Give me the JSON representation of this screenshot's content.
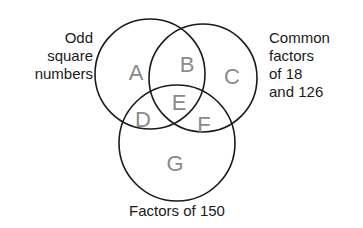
{
  "diagram": {
    "type": "venn",
    "sets": [
      {
        "id": "odd-square-numbers",
        "label_lines": [
          "Odd",
          "square",
          "numbers"
        ]
      },
      {
        "id": "common-factors",
        "label_lines": [
          "Common",
          "factors",
          "of 18",
          "and 126"
        ]
      },
      {
        "id": "factors-of-150",
        "label_lines": [
          "Factors of 150"
        ]
      }
    ],
    "regions": [
      {
        "letter": "A",
        "membership": [
          "odd-square-numbers"
        ]
      },
      {
        "letter": "B",
        "membership": [
          "odd-square-numbers",
          "common-factors"
        ]
      },
      {
        "letter": "C",
        "membership": [
          "common-factors"
        ]
      },
      {
        "letter": "D",
        "membership": [
          "odd-square-numbers",
          "factors-of-150"
        ]
      },
      {
        "letter": "E",
        "membership": [
          "odd-square-numbers",
          "common-factors",
          "factors-of-150"
        ]
      },
      {
        "letter": "F",
        "membership": [
          "common-factors",
          "factors-of-150"
        ]
      },
      {
        "letter": "G",
        "membership": [
          "factors-of-150"
        ]
      }
    ],
    "colors": {
      "outline": "#1a1a1a",
      "region_letter": "#8a8a8a",
      "label_text": "#1a1a1a",
      "background": "#ffffff"
    }
  }
}
